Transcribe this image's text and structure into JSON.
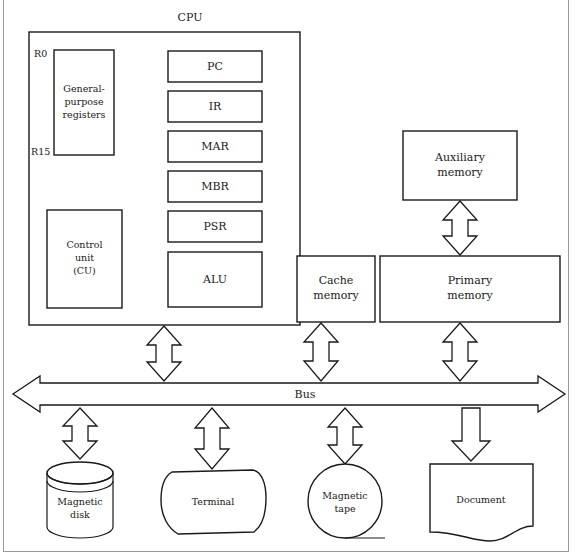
{
  "diagram": {
    "cpu": {
      "label": "CPU",
      "registers_block": {
        "label_line1": "General-",
        "label_line2": "purpose",
        "label_line3": "registers",
        "top_marker": "R0",
        "bottom_marker": "R15"
      },
      "control_unit": {
        "label_line1": "Control",
        "label_line2": "unit",
        "label_line3": "(CU)"
      },
      "registers": [
        {
          "label": "PC"
        },
        {
          "label": "IR"
        },
        {
          "label": "MAR"
        },
        {
          "label": "MBR"
        },
        {
          "label": "PSR"
        },
        {
          "label": "ALU"
        }
      ]
    },
    "memory": {
      "auxiliary": {
        "label_line1": "Auxiliary",
        "label_line2": "memory"
      },
      "primary": {
        "label_line1": "Primary",
        "label_line2": "memory"
      },
      "cache": {
        "label_line1": "Cache",
        "label_line2": "memory"
      }
    },
    "bus": {
      "label": "Bus"
    },
    "devices": [
      {
        "name": "magnetic-disk",
        "label_line1": "Magnetic",
        "label_line2": "disk",
        "connection": "bidirectional"
      },
      {
        "name": "terminal",
        "label_line1": "Terminal",
        "label_line2": "",
        "connection": "bidirectional"
      },
      {
        "name": "magnetic-tape",
        "label_line1": "Magnetic",
        "label_line2": "tape",
        "connection": "bidirectional"
      },
      {
        "name": "document",
        "label_line1": "Document",
        "label_line2": "",
        "connection": "output"
      }
    ],
    "colors": {
      "line": "#1a1a1a",
      "fill": "#ffffff",
      "page_border": "#9a9a9a"
    }
  }
}
